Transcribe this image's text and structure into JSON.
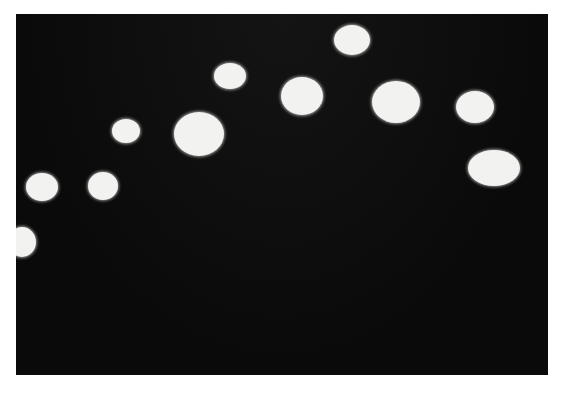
{
  "photo": {
    "background": "#0c0c0c",
    "frame": {
      "x": 16,
      "y": 14,
      "width": 532,
      "height": 361
    },
    "spot_color": "#f2f2f0",
    "spots": [
      {
        "cx": 352,
        "cy": 40,
        "rx": 18,
        "ry": 15
      },
      {
        "cx": 230,
        "cy": 76,
        "rx": 16,
        "ry": 13
      },
      {
        "cx": 302,
        "cy": 96,
        "rx": 21,
        "ry": 19
      },
      {
        "cx": 396,
        "cy": 102,
        "rx": 24,
        "ry": 21
      },
      {
        "cx": 475,
        "cy": 107,
        "rx": 19,
        "ry": 16
      },
      {
        "cx": 126,
        "cy": 131,
        "rx": 14,
        "ry": 12
      },
      {
        "cx": 199,
        "cy": 134,
        "rx": 25,
        "ry": 22
      },
      {
        "cx": 494,
        "cy": 168,
        "rx": 26,
        "ry": 18
      },
      {
        "cx": 42,
        "cy": 187,
        "rx": 16,
        "ry": 14
      },
      {
        "cx": 103,
        "cy": 186,
        "rx": 15,
        "ry": 14
      },
      {
        "cx": 22,
        "cy": 242,
        "rx": 14,
        "ry": 15
      }
    ]
  }
}
